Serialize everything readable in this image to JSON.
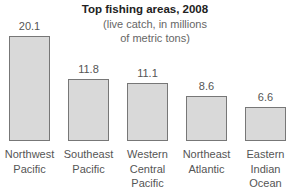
{
  "chart_data": {
    "type": "bar",
    "title": "Top fishing areas, 2008",
    "subtitle": "(live catch, in millions of metric tons)",
    "categories": [
      "Northwest Pacific",
      "Southeast Pacific",
      "Western Central Pacific",
      "Northeast Atlantic",
      "Eastern Indian Ocean"
    ],
    "values": [
      20.1,
      11.8,
      11.1,
      8.6,
      6.6
    ],
    "value_labels": [
      "20.1",
      "11.8",
      "11.1",
      "8.6",
      "6.6"
    ],
    "xlabel": "",
    "ylabel": "",
    "ylim": [
      0,
      20.1
    ],
    "grid": false,
    "legend": "none",
    "bar_color": "#d9d9d9",
    "bar_border_color": "#777777"
  },
  "labels": {
    "title": "Top fishing areas, 2008",
    "subtitle_line1": "(live catch, in millions",
    "subtitle_line2": "of metric tons)",
    "cat_lines": [
      [
        "Northwest",
        "Pacific"
      ],
      [
        "Southeast",
        "Pacific"
      ],
      [
        "Western",
        "Central",
        "Pacific"
      ],
      [
        "Northeast",
        "Atlantic"
      ],
      [
        "Eastern",
        "Indian",
        "Ocean"
      ]
    ]
  }
}
